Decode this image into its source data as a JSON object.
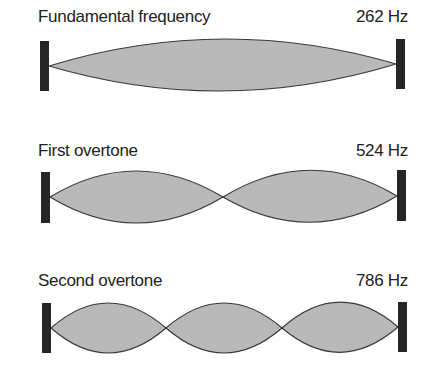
{
  "diagram": {
    "rows": [
      {
        "name": "Fundamental frequency",
        "frequency": "262 Hz",
        "segments": 1
      },
      {
        "name": "First overtone",
        "frequency": "524 Hz",
        "segments": 2
      },
      {
        "name": "Second overtone",
        "frequency": "786 Hz",
        "segments": 3
      }
    ],
    "colors": {
      "fill": "#b9b9b9",
      "stroke": "#3a3a3a",
      "endpoint": "#262626",
      "text": "#222222"
    }
  }
}
